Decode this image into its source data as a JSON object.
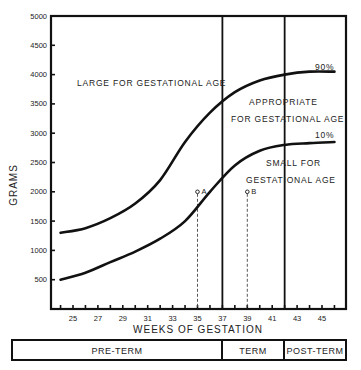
{
  "chart_data": {
    "type": "line",
    "title": "",
    "xlabel": "WEEKS OF GESTATION",
    "ylabel": "GRAMS",
    "xlim": [
      23,
      47
    ],
    "ylim": [
      0,
      5000
    ],
    "x_ticks": [
      25,
      27,
      29,
      31,
      33,
      35,
      37,
      39,
      41,
      43,
      45
    ],
    "y_ticks": [
      500,
      1000,
      1500,
      2000,
      2500,
      3000,
      3500,
      4000,
      4500,
      5000
    ],
    "grid": false,
    "x": [
      24,
      26,
      28,
      30,
      32,
      34,
      36,
      38,
      40,
      42,
      44,
      46
    ],
    "series": [
      {
        "name": "90%",
        "values": [
          1300,
          1380,
          1550,
          1800,
          2200,
          2850,
          3350,
          3700,
          3900,
          4000,
          4050,
          4050
        ]
      },
      {
        "name": "10%",
        "values": [
          500,
          620,
          800,
          980,
          1200,
          1500,
          2000,
          2450,
          2700,
          2800,
          2830,
          2850
        ]
      }
    ],
    "vertical_lines": [
      37,
      42
    ],
    "points": [
      {
        "label": "A",
        "x": 35,
        "y": 2000
      },
      {
        "label": "B",
        "x": 39,
        "y": 2000
      }
    ],
    "annotations": [
      "LARGE FOR GESTATIONAL AGE",
      "APPROPRIATE FOR GESTATIONAL AGE",
      "SMALL FOR GESTATIONAL AGE",
      "90%",
      "10%"
    ],
    "period_bands": [
      {
        "label": "PRE-TERM",
        "from": 23,
        "to": 37
      },
      {
        "label": "TERM",
        "from": 37,
        "to": 42
      },
      {
        "label": "POST-TERM",
        "from": 42,
        "to": 47
      }
    ]
  },
  "labels": {
    "y_axis": "GRAMS",
    "x_axis": "WEEKS OF GESTATION",
    "large": "LARGE FOR GESTATIONAL AGE",
    "appropriate_1": "APPROPRIATE",
    "appropriate_2": "FOR GESTATIONAL AGE",
    "small_1": "SMALL FOR",
    "small_2": "GESTATIONAL AGE",
    "p90": "90%",
    "p10": "10%",
    "point_a": "A",
    "point_b": "B",
    "preterm": "PRE-TERM",
    "term": "TERM",
    "postterm": "POST-TERM"
  },
  "colors": {
    "ink": "#111111",
    "background": "#ffffff"
  }
}
